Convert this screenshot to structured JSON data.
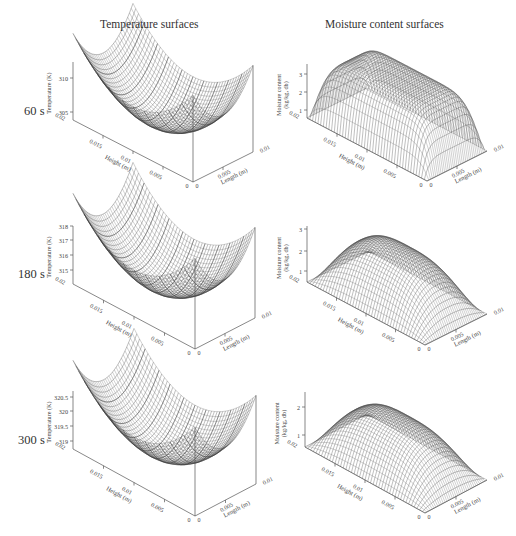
{
  "figure": {
    "columns": [
      {
        "title": "Temperature surfaces",
        "x": 100
      },
      {
        "title": "Moisture content surfaces",
        "x": 325
      }
    ],
    "rows": [
      {
        "time_label": "60 s",
        "y": 70
      },
      {
        "time_label": "180 s",
        "y": 245
      },
      {
        "time_label": "300 s",
        "y": 417
      }
    ]
  },
  "chart_data": [
    {
      "type": "surface3d",
      "title": "Temperature surfaces - 60 s",
      "zlabel": "Temperature (K)",
      "xlabel": "Height (m)",
      "ylabel": "Length (m)",
      "x_ticks": [
        "0.02",
        "0.015",
        "0.01",
        "0.005",
        "0"
      ],
      "y_ticks": [
        "0",
        "0.005",
        "0.01"
      ],
      "z_ticks": [
        "305",
        "310"
      ],
      "zlim": [
        302,
        312
      ],
      "shape": "bowl",
      "panel": {
        "ox": 73,
        "oy": 120,
        "zTop": 62,
        "hx": 193,
        "hy": 182,
        "lx": 253,
        "ly": 152,
        "zTickPos": [
          112,
          78
        ],
        "peak": 33
      }
    },
    {
      "type": "surface3d",
      "title": "Moisture content surfaces - 60 s",
      "zlabel": "Moisture content (kg/kg, db)",
      "xlabel": "Height (m)",
      "ylabel": "Length (m)",
      "x_ticks": [
        "0.02",
        "0.015",
        "0.01",
        "0.005",
        "0"
      ],
      "y_ticks": [
        "0",
        "0.005",
        "0.01"
      ],
      "z_ticks": [
        "1",
        "2",
        "3"
      ],
      "zlim": [
        0.3,
        3.6
      ],
      "shape": "plateau",
      "panel": {
        "ox": 307,
        "oy": 118,
        "zTop": 64,
        "hx": 427,
        "hy": 181,
        "lx": 487,
        "ly": 151,
        "zTickPos": [
          110,
          92,
          74
        ],
        "peak": 58
      }
    },
    {
      "type": "surface3d",
      "title": "Temperature surfaces - 180 s",
      "zlabel": "Temperature (K)",
      "xlabel": "Height (m)",
      "ylabel": "Length (m)",
      "x_ticks": [
        "0.02",
        "0.015",
        "0.01",
        "0.005",
        "0"
      ],
      "y_ticks": [
        "0",
        "0.005",
        "0.01"
      ],
      "z_ticks": [
        "315",
        "316",
        "317",
        "318"
      ],
      "zlim": [
        314.5,
        318
      ],
      "shape": "bowl",
      "panel": {
        "ox": 73,
        "oy": 284,
        "zTop": 226,
        "hx": 195,
        "hy": 349,
        "lx": 255,
        "ly": 318,
        "zTickPos": [
          270,
          255,
          240,
          226
        ],
        "peak": 193
      }
    },
    {
      "type": "surface3d",
      "title": "Moisture content surfaces - 180 s",
      "zlabel": "Moisture content (kg/kg, db)",
      "xlabel": "Height (m)",
      "ylabel": "Length (m)",
      "x_ticks": [
        "0.02",
        "0.015",
        "0.01",
        "0.005",
        "0"
      ],
      "y_ticks": [
        "0",
        "0.005",
        "0.01"
      ],
      "z_ticks": [
        "1",
        "2",
        "3"
      ],
      "zlim": [
        0.3,
        3
      ],
      "shape": "dome",
      "panel": {
        "ox": 307,
        "oy": 282,
        "zTop": 226,
        "hx": 425,
        "hy": 345,
        "lx": 487,
        "ly": 314,
        "zTickPos": [
          271,
          251,
          229
        ],
        "peak": 228
      }
    },
    {
      "type": "surface3d",
      "title": "Temperature surfaces - 300 s",
      "zlabel": "Temperature (K)",
      "xlabel": "Height (m)",
      "ylabel": "Length (m)",
      "x_ticks": [
        "0.02",
        "0.015",
        "0.01",
        "0.005",
        "0"
      ],
      "y_ticks": [
        "0",
        "0.005",
        "0.01"
      ],
      "z_ticks": [
        "319",
        "319.5",
        "320",
        "320.5"
      ],
      "zlim": [
        318.7,
        320.6
      ],
      "shape": "bowl",
      "panel": {
        "ox": 73,
        "oy": 449,
        "zTop": 391,
        "hx": 195,
        "hy": 516,
        "lx": 256,
        "ly": 484,
        "zTickPos": [
          441,
          426,
          411,
          397
        ],
        "peak": 360
      }
    },
    {
      "type": "surface3d",
      "title": "Moisture content surfaces - 300 s",
      "zlabel": "Moisture content (kg/kg, db)",
      "xlabel": "Height (m)",
      "ylabel": "Length (m)",
      "x_ticks": [
        "0.02",
        "0.015",
        "0.01",
        "0.005",
        "0"
      ],
      "y_ticks": [
        "0",
        "0.005",
        "0.01"
      ],
      "z_ticks": [
        "1",
        "2"
      ],
      "zlim": [
        0.3,
        2.5
      ],
      "shape": "dome",
      "panel": {
        "ox": 305,
        "oy": 447,
        "zTop": 392,
        "hx": 425,
        "hy": 513,
        "lx": 487,
        "ly": 480,
        "zTickPos": [
          435,
          407
        ],
        "peak": 398
      }
    }
  ]
}
